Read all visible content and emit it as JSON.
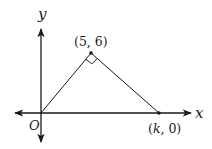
{
  "diagram": {
    "type": "coordinate-geometry",
    "axes": {
      "x_label": "x",
      "y_label": "y",
      "origin_label": "O"
    },
    "points": [
      {
        "id": "origin",
        "label": "O",
        "coords": [
          0,
          0
        ]
      },
      {
        "id": "apex",
        "label": "(5, 6)",
        "coords": [
          5,
          6
        ]
      },
      {
        "id": "base",
        "label": "(k, 0)",
        "coords": [
          "k",
          0
        ]
      }
    ],
    "labels": {
      "apex": "(5, 6)",
      "base_open": "(",
      "base_k": "k",
      "base_rest": ", 0)"
    },
    "annotations": {
      "right_angle_at": "(5, 6)"
    },
    "colors": {
      "stroke": "#1a1a1a",
      "background": "#ffffff"
    }
  }
}
